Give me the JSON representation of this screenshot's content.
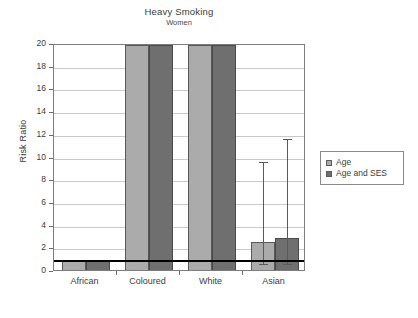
{
  "chart_data": {
    "type": "bar",
    "title": "Heavy Smoking",
    "subtitle": "Women",
    "xlabel": "",
    "ylabel": "Risk Ratio",
    "ylim": [
      0,
      20
    ],
    "ytick_step": 2,
    "yticks": [
      "20",
      "18",
      "16",
      "14",
      "12",
      "10",
      "8",
      "6",
      "4",
      "2",
      "0"
    ],
    "grid": true,
    "legend_position": "right",
    "reference_line": 1,
    "clipped_note": "bars for Coloured and White exceed the axis maximum of 20",
    "categories": [
      "African",
      "Coloured",
      "White",
      "Asian"
    ],
    "series": [
      {
        "name": "Age",
        "color": "#ababab",
        "values": [
          1.0,
          20.0,
          20.0,
          2.6
        ],
        "ci_low": [
          null,
          null,
          null,
          0.7
        ],
        "ci_high": [
          null,
          null,
          null,
          9.7
        ]
      },
      {
        "name": "Age and SES",
        "color": "#6f6f6f",
        "values": [
          1.0,
          20.0,
          20.0,
          3.0
        ],
        "ci_low": [
          null,
          null,
          null,
          0.7
        ],
        "ci_high": [
          null,
          null,
          null,
          11.7
        ]
      }
    ]
  },
  "legend": {
    "items": [
      {
        "label": "Age",
        "swatch": "age"
      },
      {
        "label": "Age and SES",
        "swatch": "ses"
      }
    ]
  }
}
